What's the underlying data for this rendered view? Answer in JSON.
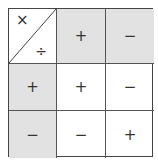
{
  "table": {
    "corner": {
      "top_left": "×",
      "bottom_right": "÷"
    },
    "column_headers": [
      "+",
      "−"
    ],
    "row_headers": [
      "+",
      "−"
    ],
    "cells": [
      [
        "+",
        "−"
      ],
      [
        "−",
        "+"
      ]
    ]
  },
  "colors": {
    "header_fill": "#e2e2e2",
    "cell_fill": "#ffffff",
    "border": "#555555"
  }
}
